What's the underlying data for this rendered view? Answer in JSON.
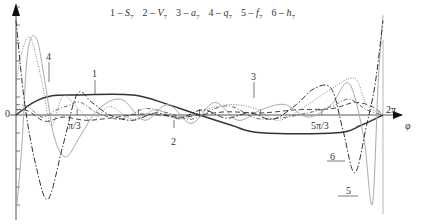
{
  "chart_data": {
    "type": "line",
    "title": "",
    "xlabel": "φ",
    "ylabel": "",
    "origin_label": "0",
    "x_ticks": [
      {
        "value": 1.0472,
        "label": "π/3"
      },
      {
        "value": 5.236,
        "label": "5π/3"
      },
      {
        "value": 6.2832,
        "label": "2π"
      }
    ],
    "xlim": [
      0,
      6.2832
    ],
    "ylim": [
      -1.0,
      1.0
    ],
    "grid": false,
    "legend_position": "top",
    "legend": [
      {
        "id": "1",
        "symbol": "S",
        "sub": "7",
        "text": "1 – S7"
      },
      {
        "id": "2",
        "symbol": "V",
        "sub": "7",
        "text": "2 – V7"
      },
      {
        "id": "3",
        "symbol": "a",
        "sub": "7",
        "text": "3 – a7"
      },
      {
        "id": "4",
        "symbol": "q",
        "sub": "7",
        "text": "4 – q7"
      },
      {
        "id": "5",
        "symbol": "f",
        "sub": "7",
        "text": "5 – f7"
      },
      {
        "id": "6",
        "symbol": "h",
        "sub": "7",
        "text": "6 – h7"
      }
    ],
    "series": [
      {
        "name": "1 – S7",
        "style": "solid-thick",
        "color": "#333333",
        "x": [
          0,
          0.3,
          0.6,
          1.0,
          2.0,
          2.6,
          3.14,
          3.7,
          4.2,
          5.5,
          5.9,
          6.2832
        ],
        "y": [
          0,
          0.12,
          0.18,
          0.19,
          0.19,
          0.1,
          0,
          -0.1,
          -0.17,
          -0.17,
          -0.1,
          0
        ]
      },
      {
        "name": "2 – V7",
        "style": "dashed",
        "color": "#444444",
        "x": [
          0,
          0.2,
          0.5,
          0.8,
          1.2,
          1.6,
          2.2,
          2.8,
          3.14,
          3.6,
          4.2,
          4.8,
          5.4,
          5.8,
          6.1,
          6.2832
        ],
        "y": [
          0.05,
          0.04,
          -0.06,
          -0.02,
          -0.05,
          -0.03,
          0.01,
          -0.02,
          0,
          0.03,
          0.02,
          0.05,
          0.06,
          0.12,
          0.08,
          0
        ]
      },
      {
        "name": "3 – a7",
        "style": "dash-dot-small",
        "color": "#555555",
        "x": [
          0,
          0.2,
          0.45,
          0.7,
          0.9,
          1.1,
          1.4,
          1.8,
          2.2,
          2.6,
          3.0,
          3.4,
          3.7,
          4.1,
          4.5,
          5.0,
          5.4,
          5.7,
          6.0,
          6.2832
        ],
        "y": [
          0.1,
          0.08,
          -0.02,
          0.05,
          0.09,
          0.12,
          0.02,
          -0.04,
          0.06,
          0.02,
          -0.04,
          0.06,
          0.08,
          -0.03,
          -0.03,
          0.02,
          0.08,
          0.15,
          0.05,
          0
        ]
      },
      {
        "name": "4 – q7",
        "style": "dotted",
        "color": "#888888",
        "x": [
          0,
          0.1,
          0.25,
          0.45,
          0.6,
          0.8,
          1.0,
          1.3,
          1.6,
          2.0,
          2.4,
          2.8,
          3.3,
          3.7,
          4.1,
          4.5,
          5.0,
          5.4,
          5.8,
          6.0,
          6.2832
        ],
        "y": [
          0.3,
          0.6,
          0.73,
          0.3,
          -0.1,
          0.18,
          0.1,
          -0.05,
          0.08,
          -0.04,
          0.05,
          -0.04,
          0.06,
          0.1,
          0.06,
          -0.05,
          0.1,
          0.25,
          0.35,
          0.1,
          0
        ]
      },
      {
        "name": "5 – f7",
        "style": "solid-light",
        "color": "#aaaaaa",
        "x": [
          0,
          0.1,
          0.2,
          0.35,
          0.5,
          0.65,
          0.85,
          1.1,
          1.4,
          1.8,
          2.2,
          2.6,
          3.0,
          3.4,
          3.8,
          4.2,
          4.6,
          5.0,
          5.4,
          5.7,
          5.95,
          6.1,
          6.2,
          6.2832
        ],
        "y": [
          -0.95,
          -0.3,
          0.6,
          0.73,
          0.3,
          -0.2,
          -0.4,
          -0.2,
          0.05,
          0.15,
          -0.05,
          0.1,
          -0.08,
          0.12,
          -0.05,
          0.05,
          0.1,
          -0.02,
          0.1,
          0.3,
          -0.2,
          -0.85,
          0.3,
          0.95
        ]
      },
      {
        "name": "6 – h7",
        "style": "dash-dot",
        "color": "#333333",
        "x": [
          0,
          0.15,
          0.35,
          0.55,
          0.8,
          1.05,
          1.3,
          1.6,
          2.0,
          2.4,
          2.8,
          3.2,
          3.6,
          4.0,
          4.4,
          4.8,
          5.1,
          5.4,
          5.6,
          5.8,
          6.0,
          6.15,
          6.2832
        ],
        "y": [
          0.9,
          0.1,
          -0.5,
          -0.8,
          -0.3,
          0.2,
          0.12,
          0.0,
          -0.05,
          0.02,
          -0.03,
          0.05,
          -0.03,
          0.02,
          -0.04,
          0.1,
          0.25,
          0.25,
          -0.15,
          -0.55,
          -0.1,
          0.3,
          0.9
        ]
      }
    ],
    "curve_labels": [
      {
        "text": "1",
        "x_px": 95,
        "y_px": 78
      },
      {
        "text": "2",
        "x_px": 174,
        "y_px": 144
      },
      {
        "text": "3",
        "x_px": 254,
        "y_px": 80
      },
      {
        "text": "4",
        "x_px": 49,
        "y_px": 60
      },
      {
        "text": "5",
        "x_px": 346,
        "y_px": 191
      },
      {
        "text": "6",
        "x_px": 333,
        "y_px": 157
      }
    ]
  }
}
